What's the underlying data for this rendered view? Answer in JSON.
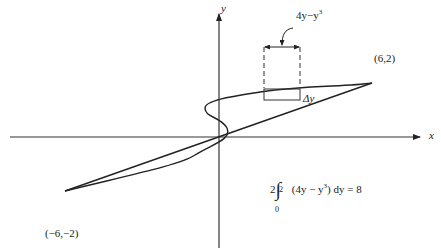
{
  "figure": {
    "type": "area-between-curves",
    "axes": {
      "x_label": "x",
      "y_label": "y"
    },
    "curves": [
      {
        "name": "line",
        "equation": "x = 3y"
      },
      {
        "name": "cubic",
        "equation": "x = y^3 - y"
      }
    ],
    "points": [
      {
        "label": "(6,2)",
        "x": 6,
        "y": 2
      },
      {
        "label": "(−6,−2)",
        "x": -6,
        "y": -2
      }
    ],
    "strip": {
      "width_label_base": "4y−y",
      "width_label_exp": "3",
      "height_label": "Δy"
    },
    "integral": {
      "coef": "2",
      "upper": "2",
      "lower": "0",
      "integrand_pre": "(4y − y",
      "integrand_exp": "3",
      "integrand_post": ") dy = 8"
    }
  }
}
